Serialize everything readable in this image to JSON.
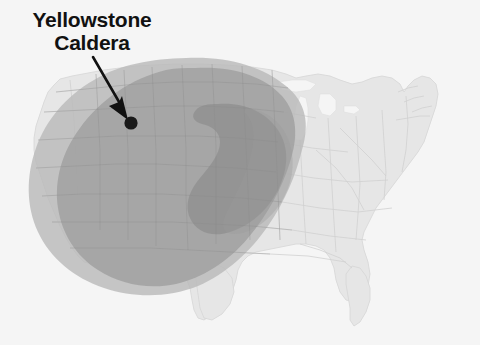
{
  "figure": {
    "type": "map",
    "background_color": "#f5f5f5"
  },
  "annotation": {
    "label_line_1": "Yellowstone",
    "label_line_2": "Caldera",
    "label_color": "#111111",
    "pointer": {
      "name": "arrow",
      "color": "#111111",
      "start_x": 93,
      "start_y": 57,
      "end_x": 128,
      "end_y": 118
    },
    "marker": {
      "name": "caldera-location-dot",
      "color": "#1a1a1a",
      "x": 131,
      "y": 123,
      "radius": 6.5
    }
  },
  "basemap": {
    "name": "contiguous-united-states",
    "fill_color": "#e6e6e6",
    "border_color": "#d2d2d2",
    "outline_color": "#cfcfcf"
  },
  "ash_zones": [
    {
      "name": "outer-ashfall-zone",
      "label": "Outer ash dispersal limit",
      "fill_color": "#b9b9b9",
      "opacity": 0.85
    },
    {
      "name": "middle-ashfall-zone",
      "label": "Moderate ash accumulation",
      "fill_color": "#a3a3a3",
      "opacity": 0.9
    },
    {
      "name": "inner-ashfall-zone",
      "label": "Heaviest ash accumulation",
      "fill_color": "#8f8f8f",
      "opacity": 0.85
    }
  ]
}
